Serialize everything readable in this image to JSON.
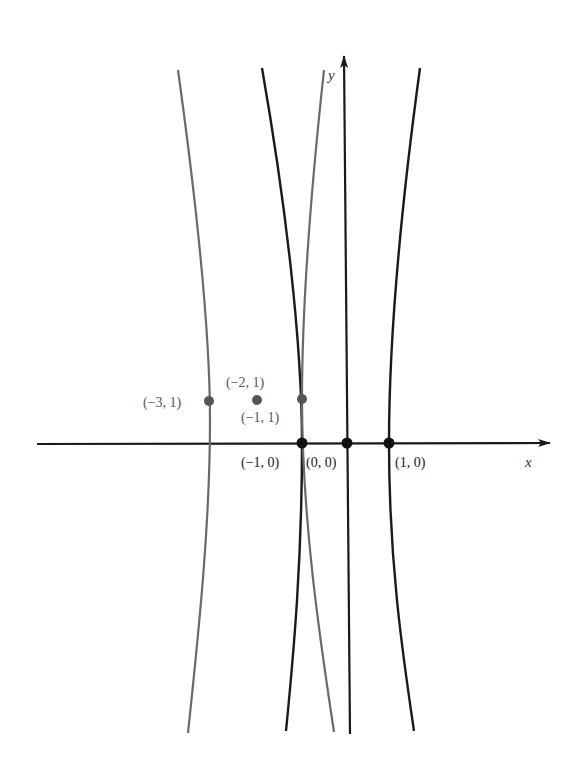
{
  "diagram": {
    "type": "coordinate-plane-curves",
    "axes": {
      "x_label": "x",
      "y_label": "y"
    },
    "colors": {
      "black_curve": "#1a1a1a",
      "gray_curve": "#6a6a6a",
      "axis": "#1a1a1a",
      "gray_point": "#555555",
      "black_point": "#111111"
    },
    "curves": [
      {
        "name": "gray-curve-left",
        "color": "gray",
        "passes_through": "(−3, 1)"
      },
      {
        "name": "black-curve-through-minus1-0",
        "color": "black",
        "passes_through": "(−1, 0)"
      },
      {
        "name": "gray-curve-through-minus1-1",
        "color": "gray",
        "passes_through": "(−1, 1)"
      },
      {
        "name": "black-line-through-origin",
        "color": "black",
        "passes_through": "(0, 0)"
      },
      {
        "name": "black-curve-through-1-0",
        "color": "black",
        "passes_through": "(1, 0)"
      }
    ],
    "points": [
      {
        "label": "(−3, 1)",
        "color": "gray"
      },
      {
        "label": "(−2, 1)",
        "color": "gray"
      },
      {
        "label": "(−1, 1)",
        "color": "gray"
      },
      {
        "label": "(−1, 0)",
        "color": "black"
      },
      {
        "label": "(0, 0)",
        "color": "black"
      },
      {
        "label": "(1, 0)",
        "color": "black"
      }
    ]
  }
}
